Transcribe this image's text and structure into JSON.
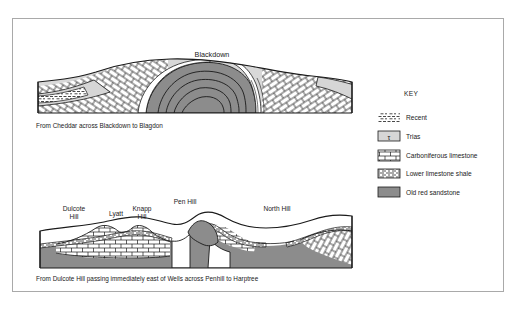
{
  "figure": {
    "frame_color": "#a9a9a9",
    "background": "#ffffff",
    "ink": "#1a1a1a"
  },
  "colors": {
    "old_red_sandstone": "#8c8c8c",
    "trias": "#d6d6d6",
    "recent": "#ffffff",
    "carboniferous_limestone": "#ffffff",
    "lower_limestone_shale": "#ffffff",
    "outline": "#1a1a1a"
  },
  "sections": [
    {
      "id": "blackdown",
      "peak_labels": [
        {
          "text": "Blackdown",
          "x": 212,
          "y": 57
        }
      ],
      "caption": "From Cheddar across Blackdown to Blagdon",
      "caption_x": 36,
      "caption_y": 128
    },
    {
      "id": "dulcote-harptree",
      "peak_labels": [
        {
          "text": "Dulcote",
          "x": 74,
          "y": 211
        },
        {
          "text": "Hill",
          "x": 74,
          "y": 219
        },
        {
          "text": "Lyatt",
          "x": 116,
          "y": 216
        },
        {
          "text": "Knapp",
          "x": 142,
          "y": 211
        },
        {
          "text": "Hill",
          "x": 142,
          "y": 219
        },
        {
          "text": "Pen Hill",
          "x": 185,
          "y": 204
        },
        {
          "text": "North Hill",
          "x": 277,
          "y": 211
        }
      ],
      "caption": "From Dulcote Hill passing immediately east of Wells across Penhill to Harptree",
      "caption_x": 36,
      "caption_y": 281
    }
  ],
  "key": {
    "title": "KEY",
    "title_x": 404,
    "title_y": 96,
    "items": [
      {
        "label": "Recent",
        "swatch": "recent",
        "y": 118
      },
      {
        "label": "Trias",
        "swatch": "trias",
        "y": 137
      },
      {
        "label": "Carboniferous limestone",
        "swatch": "carboniferous-limestone",
        "y": 156
      },
      {
        "label": "Lower limestone shale",
        "swatch": "lower-limestone-shale",
        "y": 174
      },
      {
        "label": "Old red sandstone",
        "swatch": "old-red-sandstone",
        "y": 193
      }
    ],
    "trias_glyph": "τ"
  }
}
